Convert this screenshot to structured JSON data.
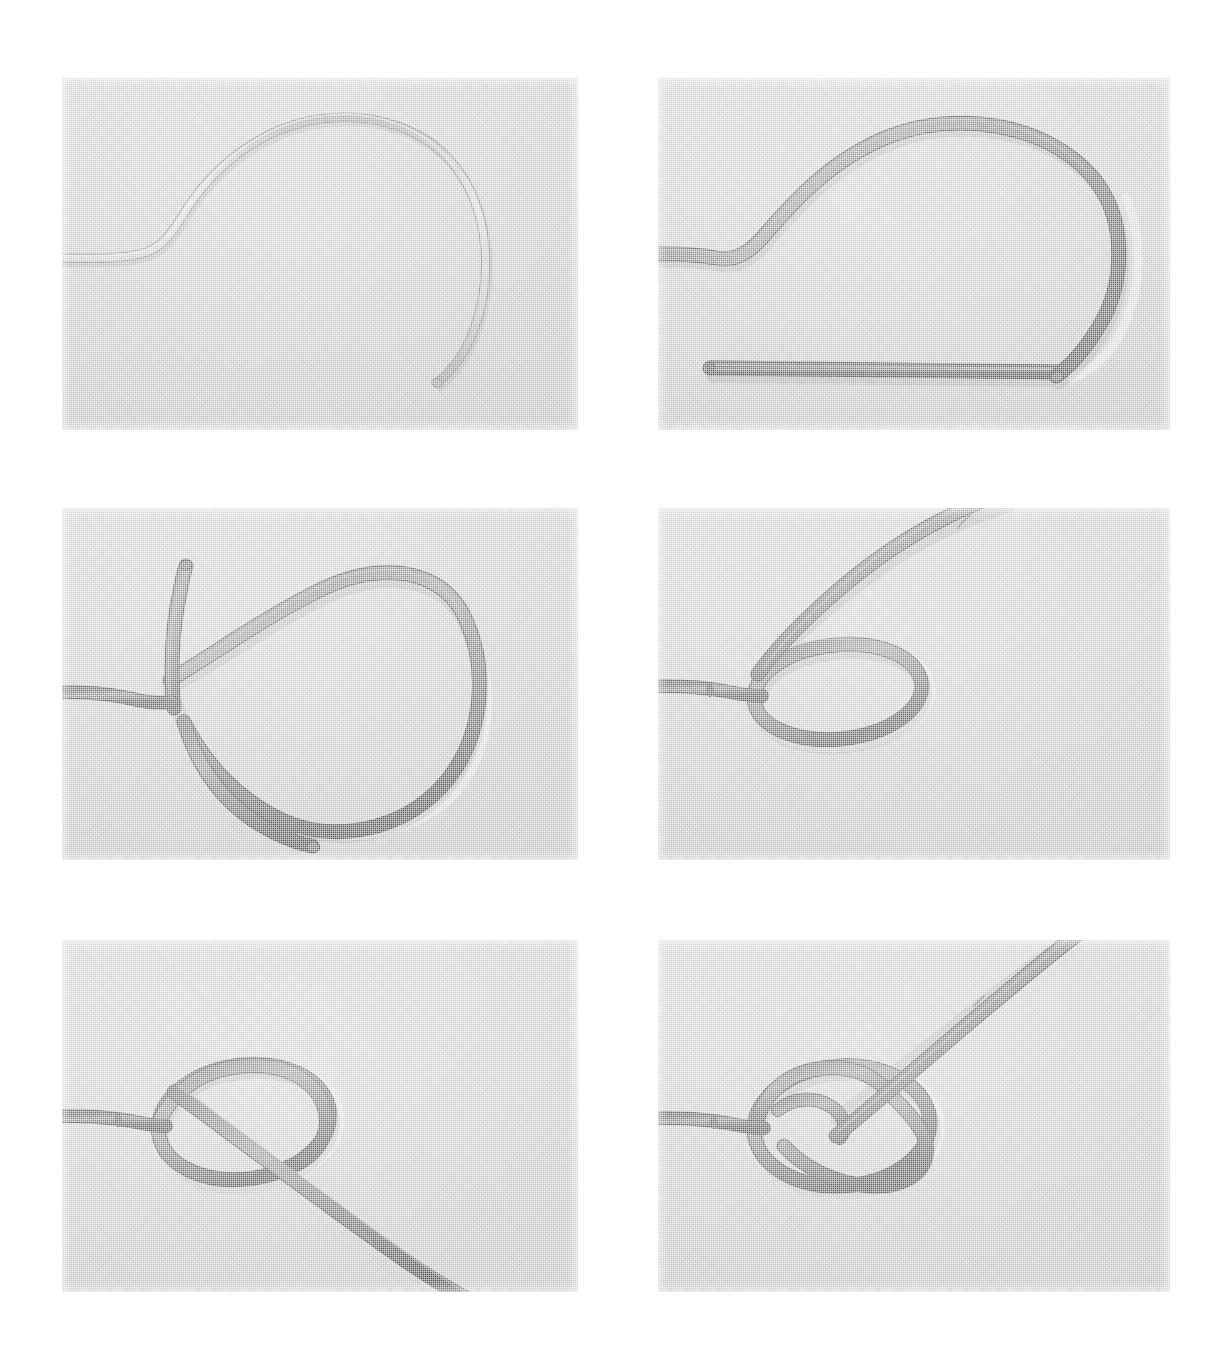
{
  "page": {
    "background_color": "#ffffff",
    "width": 1225,
    "height": 1363,
    "panel_count": 6,
    "layout": "3 rows x 2 columns photographic sequence",
    "photo_background_color": "#c9c9c9",
    "rope_dark_color": "#6e6e6e",
    "rope_light_color": "#b4b4b4",
    "rope_highlight_color": "#d8d8d8",
    "rope_shadow_color": "#4a4a4a"
  },
  "panels": [
    {
      "id": "panel-1",
      "step_number": "1",
      "caption": "",
      "description": "Light thin rope laid in a large open loop, standing part entering from the left, working end curving down to a free tip at lower right",
      "x": 62,
      "y": 78,
      "w": 516,
      "h": 352,
      "rope_tone": "light",
      "rope_width": 7
    },
    {
      "id": "panel-2",
      "step_number": "2",
      "caption": "",
      "description": "Dark thick rope forming the same large loop with the standing part running straight along the bottom and the working end tip at lower right",
      "x": 658,
      "y": 78,
      "w": 512,
      "h": 352,
      "rope_tone": "dark",
      "rope_width": 13
    },
    {
      "id": "panel-3",
      "step_number": "3",
      "caption": "",
      "description": "Loop closed into a round bight with the two rope parts crossing at the left, standing part exiting left, working end tip at bottom",
      "x": 62,
      "y": 508,
      "w": 516,
      "h": 352,
      "rope_tone": "dark",
      "rope_width": 13
    },
    {
      "id": "panel-4",
      "step_number": "4",
      "caption": "",
      "description": "Crossing pulled tight into a small round overhand eye, the working end leading away to the upper right",
      "x": 658,
      "y": 508,
      "w": 512,
      "h": 352,
      "rope_tone": "dark",
      "rope_width": 13
    },
    {
      "id": "panel-5",
      "step_number": "5",
      "caption": "",
      "description": "Working end passed up through the small eye and laid across it, running off to the lower right",
      "x": 62,
      "y": 940,
      "w": 516,
      "h": 352,
      "rope_tone": "dark",
      "rope_width": 13
    },
    {
      "id": "panel-6",
      "step_number": "6",
      "caption": "",
      "description": "Working end taken around behind the standing part and back down through the eye, forming the finished bowline",
      "x": 658,
      "y": 940,
      "w": 512,
      "h": 352,
      "rope_tone": "dark",
      "rope_width": 13
    }
  ]
}
